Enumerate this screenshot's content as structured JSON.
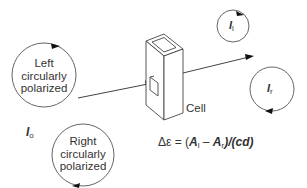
{
  "diagram": {
    "colors": {
      "line": "#444444",
      "background": "#ffffff"
    },
    "left_circle": {
      "line1": "Left",
      "line2": "circularly",
      "line3": "polarized"
    },
    "right_circle": {
      "line1": "Right",
      "line2": "circularly",
      "line3": "polarized"
    },
    "incident_intensity": {
      "symbol": "I",
      "subscript": "o"
    },
    "cell_label": "Cell",
    "output_left": {
      "symbol": "I",
      "subscript": "l"
    },
    "output_right": {
      "symbol": "I",
      "subscript": "r"
    },
    "equation": {
      "lhs": "Δε = (",
      "a_l": "A",
      "a_l_sub": "l",
      "minus": " – ",
      "a_r": "A",
      "a_r_sub": "r",
      "rhs": ")/(cd)"
    }
  }
}
